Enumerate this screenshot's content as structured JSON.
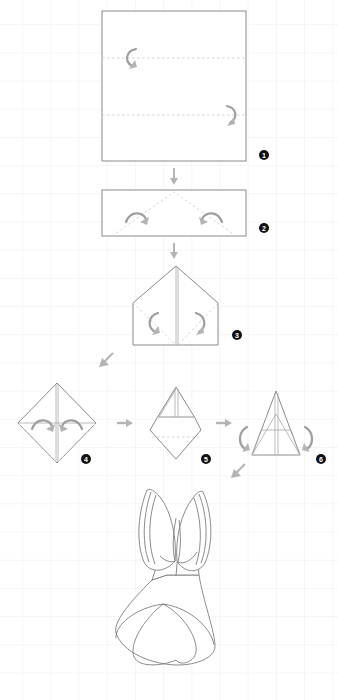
{
  "document": {
    "type": "origami-folding-instructions",
    "subject": "tulip-flower",
    "background": "#ffffff",
    "grid_color": "#f4f5f7",
    "paper_stroke": "#8a8a8a",
    "fold_line_color": "#cfcfcf",
    "arrow_color": "#9e9e9e",
    "badge_color": "#111111",
    "badge_text_color": "#ffffff"
  },
  "steps": [
    {
      "number": "1",
      "name": "square-with-horizontal-folds",
      "badge_x": 264,
      "badge_y": 155,
      "shape": {
        "kind": "square",
        "x": 102,
        "y": 11,
        "width": 144,
        "height": 150
      },
      "fold_lines": [
        {
          "x1": 102,
          "y1": 58,
          "x2": 246,
          "y2": 58
        },
        {
          "x1": 102,
          "y1": 115,
          "x2": 246,
          "y2": 115
        }
      ],
      "curved_arrows": [
        {
          "name": "fold-arrow-left",
          "path": "M 136 49 C 126 51 124 61 132 66",
          "head": "M 129 69 l 7 -1 l -2 -6 z"
        },
        {
          "name": "fold-arrow-right",
          "path": "M 227 106 C 237 108 238 118 230 123",
          "head": "M 227 126 l 7 -1 l -1 -6 z"
        }
      ]
    },
    {
      "number": "2",
      "name": "rectangle-with-diagonal-folds",
      "badge_x": 264,
      "badge_y": 228,
      "shape": {
        "kind": "rectangle",
        "x": 102,
        "y": 190,
        "width": 144,
        "height": 46
      },
      "fold_lines": [
        {
          "x1": 112,
          "y1": 236,
          "x2": 174,
          "y2": 192
        },
        {
          "x1": 236,
          "y1": 236,
          "x2": 174,
          "y2": 192
        }
      ],
      "curved_arrows": [
        {
          "name": "fold-arrow-left",
          "path": "M 127 220 C 132 210 143 211 146 218",
          "head": "M 149 216 l -2 7 l -6 -2 z"
        },
        {
          "name": "fold-arrow-right",
          "path": "M 221 220 C 216 210 205 211 202 218",
          "head": "M 199 216 l 2 7 l 6 -2 z"
        }
      ]
    },
    {
      "number": "3",
      "name": "house-shape-with-diagonal-folds",
      "badge_x": 237,
      "badge_y": 335,
      "shape": {
        "kind": "house",
        "apex_x": 176,
        "apex_y": 266,
        "left_x": 133,
        "right_x": 218,
        "shoulder_y": 303,
        "bottom_y": 345
      },
      "fold_lines": [
        {
          "x1": 133,
          "y1": 303,
          "x2": 176,
          "y2": 345
        },
        {
          "x1": 218,
          "y1": 303,
          "x2": 176,
          "y2": 345
        }
      ],
      "curved_arrows": [
        {
          "name": "fold-arrow-left",
          "path": "M 157 314 C 147 317 146 327 154 332",
          "head": "M 151 335 l 7 -1 l -2 -6 z"
        },
        {
          "name": "fold-arrow-right",
          "path": "M 196 314 C 206 317 207 327 199 332",
          "head": "M 196 335 l 7 -1 l -1 -6 z"
        }
      ]
    },
    {
      "number": "4",
      "name": "diamond-with-lower-folds",
      "badge_x": 86,
      "badge_y": 459,
      "shape": {
        "kind": "diamond",
        "cx": 57,
        "cy": 423,
        "half_width": 39,
        "half_height": 40
      },
      "fold_lines": [
        {
          "x1": 18,
          "y1": 423,
          "x2": 57,
          "y2": 463
        },
        {
          "x1": 96,
          "y1": 423,
          "x2": 57,
          "y2": 463
        }
      ],
      "crease_lines": [
        {
          "name": "vertical-center",
          "x1": 57,
          "y1": 383,
          "x2": 57,
          "y2": 463
        },
        {
          "name": "horizontal-middle",
          "x1": 18,
          "y1": 423,
          "x2": 96,
          "y2": 423
        }
      ],
      "curved_arrows": [
        {
          "name": "fold-arrow-left",
          "path": "M 33 428 C 38 418 49 419 52 426",
          "head": "M 55 424 l -2 7 l -6 -2 z"
        },
        {
          "name": "fold-arrow-right",
          "path": "M 81 428 C 76 418 65 419 62 426",
          "head": "M 59 424 l 2 7 l 6 -2 z"
        }
      ]
    },
    {
      "number": "5",
      "name": "kite-with-inner-triangle",
      "badge_x": 206,
      "badge_y": 459,
      "shape": {
        "kind": "kite",
        "apex_x": 176,
        "apex_y": 387,
        "shoulder_y": 417,
        "wide_y": 430,
        "bottom_y": 459
      },
      "fold_lines": [
        {
          "x1": 152,
          "y1": 437,
          "x2": 200,
          "y2": 437
        }
      ],
      "crease_lines": [
        {
          "name": "inner-triangle",
          "path": "M 176 387 L 157 418 L 195 418 Z"
        },
        {
          "name": "center-shaft",
          "x1": 176,
          "y1": 389,
          "x2": 176,
          "y2": 418
        }
      ],
      "curved_arrows": []
    },
    {
      "number": "6",
      "name": "tall-triangle-petal-folds",
      "badge_x": 321,
      "badge_y": 459,
      "shape": {
        "kind": "triangle",
        "apex_x": 276,
        "apex_y": 391,
        "left_x": 252,
        "right_x": 300,
        "base_y": 455
      },
      "crease_lines": [
        {
          "name": "vertical-center",
          "x1": 276,
          "y1": 393,
          "x2": 276,
          "y2": 455
        },
        {
          "name": "horizontal-band",
          "x1": 261,
          "y1": 430,
          "x2": 291,
          "y2": 430
        },
        {
          "name": "diagonal-left",
          "x1": 276,
          "y1": 415,
          "x2": 252,
          "y2": 455
        },
        {
          "name": "diagonal-right",
          "x1": 276,
          "y1": 415,
          "x2": 300,
          "y2": 455
        }
      ],
      "curved_arrows": [
        {
          "name": "fold-arrow-left",
          "path": "M 247 428 C 239 433 239 444 246 449",
          "head": "M 243 452 l 7 -1 l -2 -6 z"
        },
        {
          "name": "fold-arrow-right",
          "path": "M 305 428 C 313 433 313 444 306 449",
          "head": "M 309 452 l -7 -1 l 2 -6 z"
        }
      ]
    }
  ],
  "connector_arrows": [
    {
      "name": "arrow-step1-to-step2",
      "direction": "down",
      "x": 174,
      "y": 176
    },
    {
      "name": "arrow-step2-to-step3",
      "direction": "down",
      "x": 174,
      "y": 250
    },
    {
      "name": "arrow-step3-to-step4",
      "direction": "down-left",
      "x": 105,
      "y": 361
    },
    {
      "name": "arrow-step4-to-step5",
      "direction": "right",
      "x": 125,
      "y": 423
    },
    {
      "name": "arrow-step5-to-step6",
      "direction": "right",
      "x": 224,
      "y": 423
    },
    {
      "name": "arrow-step6-to-final",
      "direction": "down-left",
      "x": 237,
      "y": 472
    }
  ],
  "final_figure": {
    "name": "finished-tulip",
    "bounds": {
      "x": 110,
      "y": 483,
      "width": 105,
      "height": 183
    },
    "parts": [
      "left-petal",
      "right-petal",
      "center-petal-fold",
      "stem-collar",
      "cone-base",
      "base-leaf-overlay"
    ]
  }
}
